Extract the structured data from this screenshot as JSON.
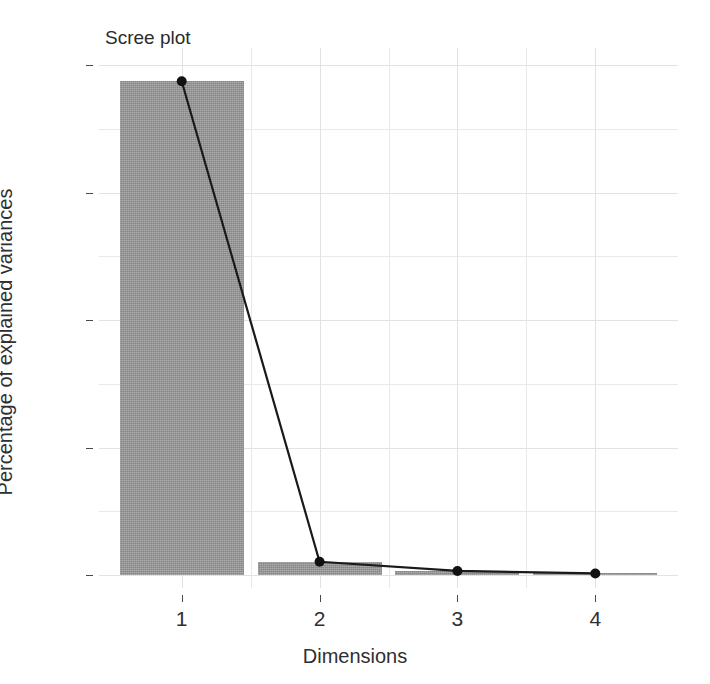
{
  "chart_data": {
    "type": "bar",
    "title": "Scree plot",
    "xlabel": "Dimensions",
    "ylabel": "Percentage of explained variances",
    "categories": [
      "1",
      "2",
      "3",
      "4"
    ],
    "values": [
      96.8,
      2.6,
      0.8,
      0.3
    ],
    "series": [
      {
        "name": "Percentage of explained variances (bars)",
        "type": "bar",
        "values": [
          96.8,
          2.6,
          0.8,
          0.3
        ]
      },
      {
        "name": "Percentage of explained variances (line)",
        "type": "line",
        "values": [
          96.8,
          2.6,
          0.8,
          0.3
        ]
      }
    ],
    "ylim": [
      0,
      100
    ],
    "xlim": [
      0.4,
      4.6
    ],
    "yticks": [
      0,
      25,
      50,
      75,
      100
    ],
    "ytick_labels": [
      "0",
      "25",
      "50",
      "75",
      "100"
    ],
    "xticks": [
      1,
      2,
      3,
      4
    ],
    "xtick_labels": [
      "1",
      "2",
      "3",
      "4"
    ],
    "minor_yticks": [
      12.5,
      37.5,
      62.5,
      87.5
    ],
    "minor_xticks": [
      1.5,
      2.5,
      3.5
    ],
    "grid": true,
    "legend": "none",
    "bar_color": "#9a9a9a",
    "line_color": "#1a1a1a",
    "point_color": "#111111",
    "panel_background": "#ffffff",
    "grid_color": "#e6e6e6",
    "bar_width": 0.9,
    "point_size": 5
  }
}
